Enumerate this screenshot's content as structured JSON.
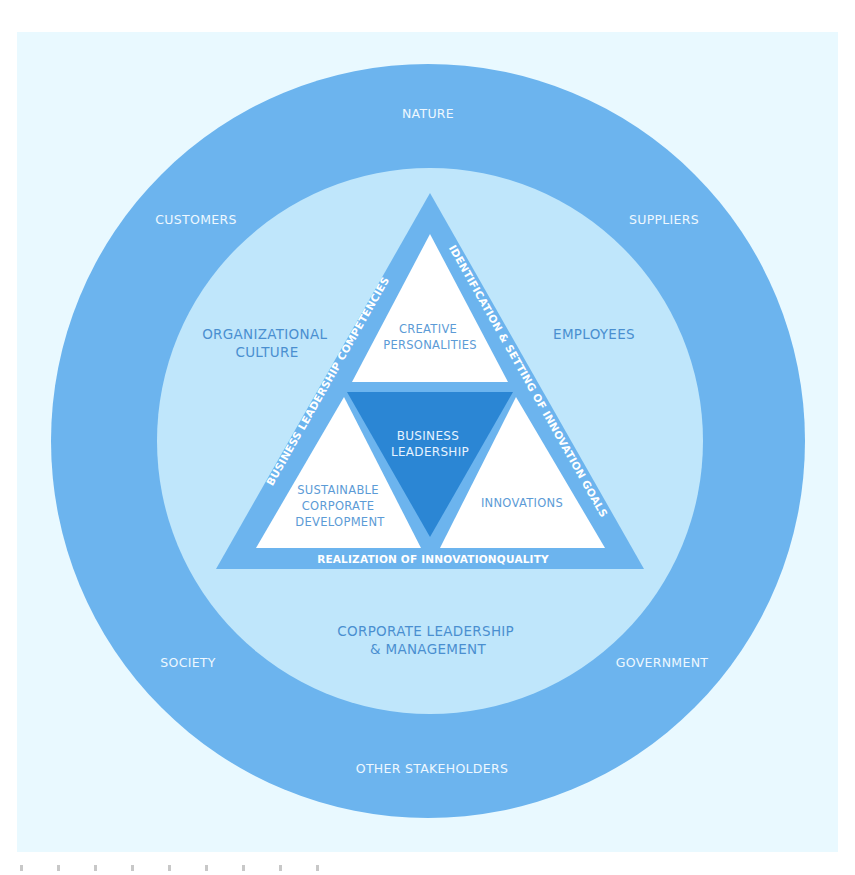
{
  "colors": {
    "page_bg": "#ffffff",
    "panel_bg": "#e9f9ff",
    "outer_ring": "#6cb4ee",
    "inner_circle": "#bfe6fb",
    "triangle_band": "#6cb4ee",
    "sub_triangle": "#ffffff",
    "core_triangle": "#2b86d4",
    "outer_text": "#eef8ff",
    "inner_text": "#4a8fd0"
  },
  "outer_ring": {
    "top": "NATURE",
    "top_left": "CUSTOMERS",
    "top_right": "SUPPLIERS",
    "bottom_left": "SOCIETY",
    "bottom_right": "GOVERNMENT",
    "bottom": "OTHER STAKEHOLDERS"
  },
  "inner_circle": {
    "left": [
      "ORGANIZATIONAL",
      "CULTURE"
    ],
    "right": "EMPLOYEES",
    "bottom": [
      "CORPORATE LEADERSHIP",
      "& MANAGEMENT"
    ]
  },
  "triangle": {
    "left_edge": "BUSINESS LEADERSHIP COMPETENCIES",
    "right_edge": "IDENTIFICATION & SETTING OF INNOVATION GOALS",
    "bottom_edge": "REALIZATION OF INNOVATIONQUALITY",
    "top": [
      "CREATIVE",
      "PERSONALITIES"
    ],
    "center": [
      "BUSINESS",
      "LEADERSHIP"
    ],
    "bottom_left": [
      "SUSTAINABLE",
      "CORPORATE",
      "DEVELOPMENT"
    ],
    "bottom_right": "INNOVATIONS"
  }
}
